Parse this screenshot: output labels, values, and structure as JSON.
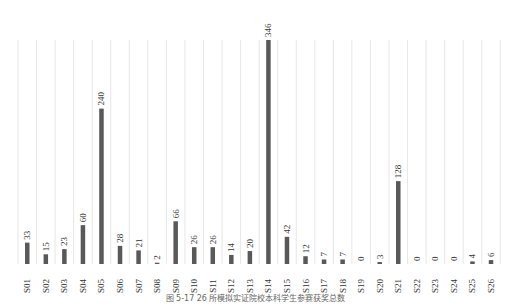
{
  "chart_data": {
    "type": "bar",
    "title": "",
    "xlabel": "",
    "ylabel": "",
    "categories": [
      "S01",
      "S02",
      "S03",
      "S04",
      "S05",
      "S06",
      "S07",
      "S08",
      "S09",
      "S10",
      "S11",
      "S12",
      "S13",
      "S14",
      "S15",
      "S16",
      "S17",
      "S18",
      "S19",
      "S20",
      "S21",
      "S22",
      "S23",
      "S24",
      "S25",
      "S26"
    ],
    "values": [
      33,
      15,
      23,
      60,
      240,
      28,
      21,
      2,
      66,
      26,
      26,
      14,
      20,
      346,
      42,
      12,
      7,
      7,
      0,
      3,
      128,
      0,
      0,
      0,
      4,
      6
    ],
    "ylim": [
      0,
      346
    ],
    "grid": "vertical",
    "legend": "none",
    "data_labels": true,
    "bar_color": "#595959"
  },
  "caption": "图 5-17  26 所模拟实证院校本科学生参赛获奖总数"
}
